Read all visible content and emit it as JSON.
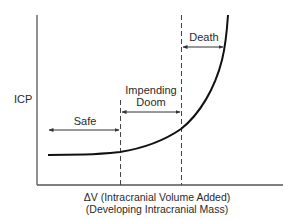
{
  "diagram": {
    "type": "pressure-volume curve",
    "y_axis_label": "ICP",
    "x_axis_label_line1": "ΔV (Intracranial Volume Added)",
    "x_axis_label_line2": "(Developing Intracranial Mass)",
    "zones": [
      {
        "id": "safe",
        "label": "Safe"
      },
      {
        "id": "impending-doom",
        "label_line1": "Impending",
        "label_line2": "Doom"
      },
      {
        "id": "death",
        "label": "Death"
      }
    ],
    "colors": {
      "axis": "#555555",
      "curve": "#111111",
      "dashed": "#444444",
      "arrow": "#333333",
      "text": "#2a2a2a"
    }
  }
}
